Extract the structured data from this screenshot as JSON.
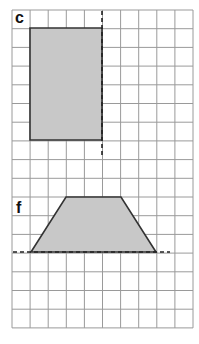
{
  "grid": {
    "left": 12,
    "top": 10,
    "cols": 10,
    "rows": 17,
    "cell_w": 18.1,
    "cell_h": 18.7,
    "line_color": "#9a9a9a"
  },
  "figures": [
    {
      "label": "c",
      "shape": "rectangle",
      "points": [
        [
          30,
          28
        ],
        [
          102,
          28
        ],
        [
          102,
          140
        ],
        [
          30,
          140
        ]
      ],
      "fill": "#c8c8c8",
      "stroke": "#333333",
      "mirror_line": {
        "orientation": "vertical",
        "x1": 102,
        "y1": 11,
        "x2": 102,
        "y2": 158
      }
    },
    {
      "label": "f",
      "shape": "trapezoid",
      "points": [
        [
          66,
          197
        ],
        [
          121,
          197
        ],
        [
          156,
          252
        ],
        [
          31,
          252
        ]
      ],
      "fill": "#c8c8c8",
      "stroke": "#333333",
      "mirror_line": {
        "orientation": "horizontal",
        "x1": 13,
        "y1": 252,
        "x2": 170,
        "y2": 252
      }
    }
  ]
}
